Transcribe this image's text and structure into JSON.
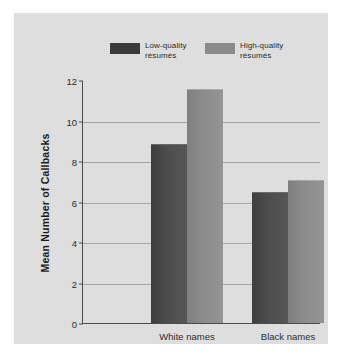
{
  "chart_data": {
    "type": "bar",
    "title": "",
    "xlabel": "",
    "ylabel": "Mean Number of Callbacks",
    "categories": [
      "White names",
      "Black names"
    ],
    "series": [
      {
        "name": "Low-quality résumés",
        "values": [
          8.8,
          6.4
        ],
        "color": "#4a4a4a"
      },
      {
        "name": "High-quality résumés",
        "values": [
          11.5,
          7.0
        ],
        "color": "#8c8c8c"
      }
    ],
    "ylim": [
      0,
      12
    ],
    "yticks": [
      0,
      2,
      4,
      6,
      8,
      10,
      12
    ],
    "ytick_labels": [
      "0",
      "2",
      "4",
      "6",
      "8",
      "10",
      "12"
    ],
    "grid": "horizontal",
    "gridline_values": [
      2,
      4,
      6,
      8,
      10
    ],
    "legend_position": "top"
  },
  "legend": {
    "entries": [
      {
        "label": "Low-quality\nrésumés",
        "color": "#3a3a3a"
      },
      {
        "label": "High-quality\nrésumés",
        "color": "#8a8a8a"
      }
    ]
  },
  "colors": {
    "panel_background": "#e0e0e0",
    "figure_background": "#ffffff",
    "axis": "#4a4a4a",
    "gridline": "#a6a6a6",
    "text": "#2b2b2b"
  }
}
